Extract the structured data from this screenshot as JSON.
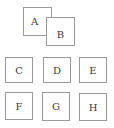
{
  "diagram": {
    "top_group": [
      {
        "id": "A",
        "label": "A"
      },
      {
        "id": "B",
        "label": "B"
      }
    ],
    "grid": {
      "rows": [
        [
          {
            "id": "C",
            "label": "C"
          },
          {
            "id": "D",
            "label": "D"
          },
          {
            "id": "E",
            "label": "E"
          }
        ],
        [
          {
            "id": "F",
            "label": "F"
          },
          {
            "id": "G",
            "label": "G"
          },
          {
            "id": "H",
            "label": "H"
          }
        ]
      ]
    },
    "colors": {
      "border": "#9a9a9a",
      "text": "#3a3a3a",
      "background": "#ffffff"
    }
  }
}
